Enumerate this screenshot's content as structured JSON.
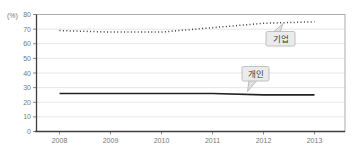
{
  "chart": {
    "unit_label": "(%)",
    "colors": {
      "background": "#ffffff",
      "grid": "#e6e6e6",
      "frame": "#ababab",
      "axis": "#3f3f3f",
      "tick_text": "#787878",
      "callout_fill": "#ebebeb",
      "callout_border": "#b3b3b3",
      "callout_text": "#3c3c3c"
    }
  },
  "chart_data": {
    "type": "line",
    "title": "",
    "xlabel": "",
    "ylabel": "(%)",
    "categories": [
      "2008",
      "2009",
      "2010",
      "2011",
      "2012",
      "2013"
    ],
    "series": [
      {
        "name": "기업",
        "style": "dotted",
        "color": "#3c3c3c",
        "values": [
          69,
          68,
          68,
          71,
          74,
          75
        ]
      },
      {
        "name": "개인",
        "style": "solid",
        "color": "#222222",
        "values": [
          26,
          26,
          26,
          26,
          25,
          25
        ]
      }
    ],
    "ylim": [
      0,
      80
    ],
    "yticks": [
      0,
      10,
      20,
      30,
      40,
      50,
      60,
      70,
      80
    ],
    "grid": true,
    "legend_position": "inline-callouts"
  }
}
